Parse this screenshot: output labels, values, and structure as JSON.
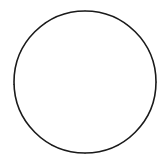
{
  "figure": {
    "shape": "circle",
    "center_x": 85,
    "center_y": 82,
    "radius": 71,
    "outline_color": "#1a1a1a",
    "background_color": "#ffffff",
    "shaded_fill_pattern": "diagonal-hatch",
    "hatch_color": "#2b2b2b",
    "hatch_angle_degrees": 45,
    "hatch_spacing_px": 5,
    "total_sectors": 12,
    "shaded_sectors": 7,
    "unshaded_sectors": 5,
    "fraction_shaded": "7/12"
  },
  "chart_data": {
    "type": "pie",
    "xlabel": "",
    "ylabel": "",
    "categories": [
      "sector-1",
      "sector-2",
      "sector-3",
      "sector-4",
      "sector-5",
      "sector-6",
      "sector-7",
      "sector-8",
      "sector-9",
      "sector-10",
      "sector-11",
      "sector-12"
    ],
    "values": [
      36,
      28,
      26,
      28,
      34,
      32,
      28,
      30,
      30,
      28,
      30,
      30
    ],
    "legend": [],
    "sectors": [
      {
        "id": "sector-1",
        "start_angle": -90,
        "end_angle": -54,
        "shaded": true,
        "label": "shaded"
      },
      {
        "id": "sector-2",
        "start_angle": -54,
        "end_angle": -26,
        "shaded": true,
        "label": "shaded"
      },
      {
        "id": "sector-3",
        "start_angle": -26,
        "end_angle": 0,
        "shaded": true,
        "label": "shaded"
      },
      {
        "id": "sector-4",
        "start_angle": 0,
        "end_angle": 28,
        "shaded": true,
        "label": "shaded"
      },
      {
        "id": "sector-5",
        "start_angle": 28,
        "end_angle": 62,
        "shaded": true,
        "label": "shaded"
      },
      {
        "id": "sector-6",
        "start_angle": 62,
        "end_angle": 90,
        "shaded": true,
        "label": "shaded"
      },
      {
        "id": "sector-7",
        "start_angle": 90,
        "end_angle": 118,
        "shaded": true,
        "label": "shaded"
      },
      {
        "id": "sector-8",
        "start_angle": 118,
        "end_angle": 148,
        "shaded": false,
        "label": "unshaded"
      },
      {
        "id": "sector-9",
        "start_angle": 148,
        "end_angle": 178,
        "shaded": false,
        "label": "unshaded"
      },
      {
        "id": "sector-10",
        "start_angle": 178,
        "end_angle": 206,
        "shaded": false,
        "label": "unshaded"
      },
      {
        "id": "sector-11",
        "start_angle": 206,
        "end_angle": 236,
        "shaded": false,
        "label": "unshaded"
      },
      {
        "id": "sector-12",
        "start_angle": 236,
        "end_angle": 270,
        "shaded": false,
        "label": "unshaded"
      }
    ]
  }
}
